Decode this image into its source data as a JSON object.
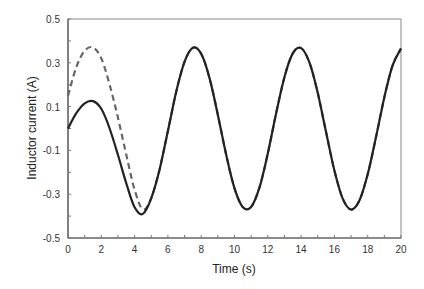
{
  "chart_data": {
    "type": "line",
    "title": "",
    "xlabel": "Time (s)",
    "ylabel": "Inductor current (A)",
    "xlim": [
      0,
      20
    ],
    "ylim": [
      -0.5,
      0.5
    ],
    "x_ticks": [
      0,
      2,
      4,
      6,
      8,
      10,
      12,
      14,
      16,
      18,
      20
    ],
    "x_tick_labels": [
      "0",
      "2",
      "4",
      "6",
      "8",
      "10",
      "12",
      "14",
      "16",
      "18",
      "20"
    ],
    "y_ticks": [
      0.5,
      0.3,
      0.1,
      -0.1,
      -0.3,
      -0.5
    ],
    "y_tick_labels": [
      "0.5",
      "0.3",
      "0.1",
      "-0.1",
      "-0.3",
      "-0.5"
    ],
    "grid": false,
    "legend": null,
    "x": [
      0,
      0.5,
      1,
      1.5,
      2,
      2.5,
      3,
      3.5,
      4,
      4.5,
      5,
      5.5,
      6,
      6.5,
      7,
      7.5,
      8,
      8.5,
      9,
      9.5,
      10,
      10.5,
      11,
      11.5,
      12,
      12.5,
      13,
      13.5,
      14,
      14.5,
      15,
      15.5,
      16,
      16.5,
      17,
      17.5,
      18,
      18.5,
      19,
      19.5,
      20
    ],
    "series": [
      {
        "name": "solid",
        "style": "solid",
        "color": "#222222",
        "values": [
          0.0,
          0.07,
          0.115,
          0.125,
          0.09,
          0.0,
          -0.12,
          -0.25,
          -0.36,
          -0.39,
          -0.318,
          -0.187,
          -0.011,
          0.168,
          0.305,
          0.369,
          0.341,
          0.23,
          0.063,
          -0.12,
          -0.273,
          -0.359,
          -0.358,
          -0.269,
          -0.114,
          0.069,
          0.235,
          0.343,
          0.367,
          0.302,
          0.162,
          -0.017,
          -0.192,
          -0.32,
          -0.37,
          -0.329,
          -0.209,
          -0.039,
          0.142,
          0.289,
          0.365
        ]
      },
      {
        "name": "dashed",
        "style": "dashed",
        "color": "#666666",
        "values": [
          0.15,
          0.28,
          0.355,
          0.37,
          0.32,
          0.2,
          0.05,
          -0.12,
          -0.28,
          -0.37,
          -0.318,
          -0.187,
          -0.011,
          0.168,
          0.305,
          0.369,
          0.341,
          0.23,
          0.063,
          -0.12,
          -0.273,
          -0.359,
          -0.358,
          -0.269,
          -0.114,
          0.069,
          0.235,
          0.343,
          0.367,
          0.302,
          0.162,
          -0.017,
          -0.192,
          -0.32,
          -0.37,
          -0.329,
          -0.209,
          -0.039,
          0.142,
          0.289,
          0.365
        ]
      }
    ]
  }
}
